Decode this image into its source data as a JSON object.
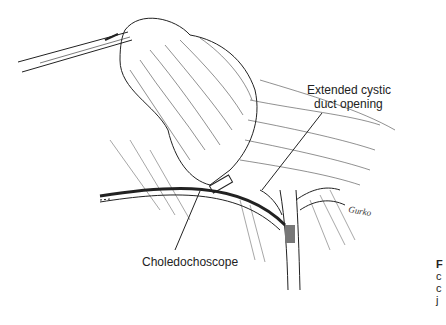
{
  "figure": {
    "labels": {
      "cystic_duct": [
        "Extended cystic",
        "duct opening"
      ],
      "choledochoscope": "Choledochoscope"
    },
    "signature": "Gurko",
    "caption_fragment": [
      "F",
      "c",
      "c",
      "j"
    ]
  }
}
